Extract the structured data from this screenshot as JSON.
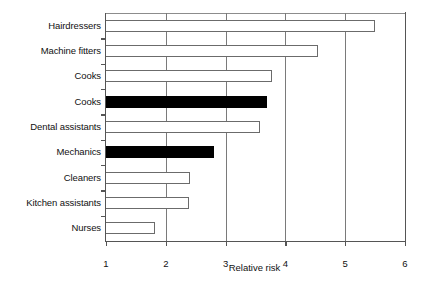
{
  "chart_data": {
    "type": "bar",
    "orientation": "horizontal",
    "title": "",
    "xlabel": "Relative risk",
    "ylabel": "",
    "xlim": [
      1,
      6
    ],
    "xticks": [
      1,
      2,
      3,
      4,
      5,
      6
    ],
    "xtick_labels": [
      "1",
      "2",
      "3",
      "4",
      "5",
      "6"
    ],
    "grid": true,
    "grid_axis": "x",
    "legend": null,
    "baseline": 1,
    "categories": [
      "Hairdressers",
      "Machine fitters",
      "Cooks",
      "Cooks",
      "Dental assistants",
      "Mechanics",
      "Cleaners",
      "Kitchen assistants",
      "Nurses"
    ],
    "values": [
      5.5,
      4.55,
      3.78,
      3.7,
      3.58,
      2.8,
      2.4,
      2.38,
      1.82
    ],
    "styles": [
      "open",
      "open",
      "open",
      "filled",
      "open",
      "filled",
      "open",
      "open",
      "open"
    ],
    "colors": {
      "open_fill": "#ffffff",
      "open_edge": "#6b6b6b",
      "filled_fill": "#000000",
      "axis": "#555555",
      "grid": "#7a7a7a",
      "text": "#111111",
      "background": "#ffffff"
    }
  }
}
